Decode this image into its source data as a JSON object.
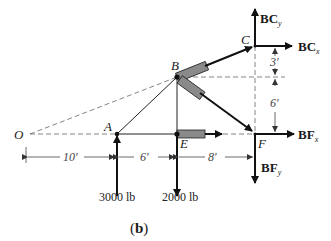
{
  "diagram": {
    "caption": "(b)",
    "points": {
      "O": "O",
      "A": "A",
      "B": "B",
      "C": "C",
      "E": "E",
      "F": "F"
    },
    "forces": {
      "BCy": {
        "main": "BC",
        "sub": "y"
      },
      "BCx": {
        "main": "BC",
        "sub": "x"
      },
      "BFx": {
        "main": "BF",
        "sub": "x"
      },
      "BFy": {
        "main": "BF",
        "sub": "y"
      }
    },
    "loads": {
      "A": "3000 lb",
      "E": "2000 lb"
    },
    "dimensions": {
      "horizontal": [
        "10′",
        "6′",
        "8′"
      ],
      "vertical": [
        "3′",
        "6′"
      ]
    },
    "colors": {
      "line": "#1a1a1a",
      "dash": "#666666",
      "member": "#8a8a8a"
    }
  }
}
